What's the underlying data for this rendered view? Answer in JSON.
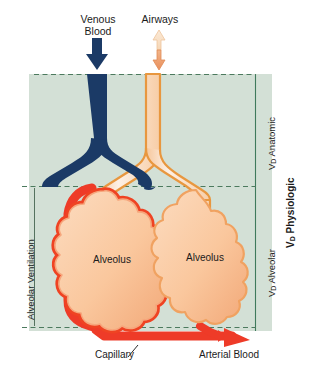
{
  "figure": {
    "background_panel_color": "#d3e0d6",
    "panel_border_color": "#4a7a62",
    "dashed_line_color": "#4c7a5e"
  },
  "top_labels": [
    {
      "name": "venous-blood",
      "line1": "Venous",
      "line2": "Blood",
      "arrow": "down-arrow-icon",
      "color": "#1b3a66"
    },
    {
      "name": "airways",
      "line1": "Airways",
      "line2": "",
      "arrow": "up-down-arrow-icon",
      "color": "#efa978"
    }
  ],
  "alveoli": [
    {
      "name": "alveolus-perfused",
      "label": "Alveolus",
      "outline_color": "#ef4323",
      "fill_color": "#f9c49a",
      "perfused": "yes"
    },
    {
      "name": "alveolus-dead-space",
      "label": "Alveolus",
      "outline_color": "#f0a261",
      "fill_color": "#f9c49a",
      "perfused": "no"
    }
  ],
  "bottom_labels": [
    {
      "name": "capillary",
      "text": "Capillary"
    },
    {
      "name": "arterial-blood",
      "text": "Arterial Blood"
    }
  ],
  "left_bracket": {
    "name": "alveolar-ventilation",
    "text": "Alveolar Ventilation"
  },
  "right_labels": [
    {
      "name": "vd-anatomic",
      "prefix": "V",
      "sub": "D",
      "suffix": " Anatomic",
      "bold": false
    },
    {
      "name": "vd-alveolar",
      "prefix": "V",
      "sub": "D",
      "suffix": " Alveolar",
      "bold": false
    },
    {
      "name": "vd-physiologic",
      "prefix": "V",
      "sub": "D",
      "suffix": " Physiologic",
      "bold": true
    }
  ],
  "vessels": {
    "venous_color": "#1b3a66",
    "airway_wall_color": "#e8973f",
    "airway_lumen_color": "#fdece0",
    "capillary_color": "#ee3b28"
  }
}
